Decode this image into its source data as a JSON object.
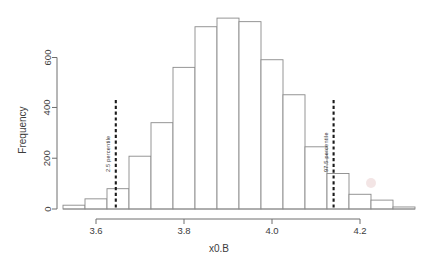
{
  "chart_data": {
    "type": "bar",
    "title": "",
    "subtitle": "",
    "xlabel": "x0.B",
    "ylabel": "Frequency",
    "xlim": [
      3.525,
      4.325
    ],
    "ylim": [
      0,
      780
    ],
    "grid": false,
    "legend": "none",
    "bin_width": 0.05,
    "bin_edges": [
      3.525,
      3.575,
      3.625,
      3.675,
      3.725,
      3.775,
      3.825,
      3.875,
      3.925,
      3.975,
      4.025,
      4.075,
      4.125,
      4.175,
      4.225,
      4.275,
      4.325
    ],
    "bin_centers": [
      3.55,
      3.6,
      3.65,
      3.7,
      3.75,
      3.8,
      3.85,
      3.9,
      3.95,
      4.0,
      4.05,
      4.1,
      4.15,
      4.2,
      4.25,
      4.3
    ],
    "values": [
      15,
      40,
      80,
      208,
      340,
      558,
      718,
      752,
      738,
      588,
      450,
      245,
      140,
      58,
      35,
      8
    ],
    "categories": [
      "3.55",
      "3.60",
      "3.65",
      "3.70",
      "3.75",
      "3.80",
      "3.85",
      "3.90",
      "3.95",
      "4.00",
      "4.05",
      "4.10",
      "4.15",
      "4.20",
      "4.25",
      "4.30"
    ],
    "x_ticks": [
      3.6,
      3.8,
      4.0,
      4.2
    ],
    "x_tick_labels": [
      "3.6",
      "3.8",
      "4.0",
      "4.2"
    ],
    "y_ticks": [
      0,
      200,
      400,
      600
    ],
    "y_tick_labels": [
      "0",
      "200",
      "400",
      "600"
    ],
    "annotations": [
      {
        "name": "lower-percentile",
        "label": "2.5 percentile",
        "x": 3.645,
        "style": "dashed-vertical"
      },
      {
        "name": "upper-percentile",
        "label": "97.5 percentile",
        "x": 4.14,
        "style": "dashed-vertical"
      }
    ],
    "colors": {
      "bar_fill": "#ffffff",
      "bar_stroke": "#8a8a8a",
      "axis": "#6e6e6e",
      "text": "#3c3c3c",
      "percentile_line": "#1a1a1a",
      "background": "#ffffff"
    }
  },
  "axes": {
    "y_title": "Frequency",
    "x_title": "x0.B",
    "y_tick_labels": [
      "0",
      "200",
      "400",
      "600"
    ],
    "x_tick_labels": [
      "3.6",
      "3.8",
      "4.0",
      "4.2"
    ]
  },
  "annotations": {
    "lower": "2.5 percentile",
    "upper": "97.5 percentile"
  }
}
